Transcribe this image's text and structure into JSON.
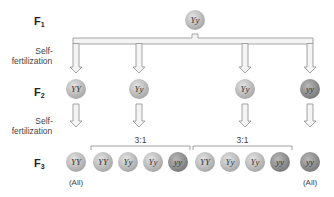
{
  "generations": {
    "f1": {
      "letter": "F",
      "sub": "1"
    },
    "f2": {
      "letter": "F",
      "sub": "2"
    },
    "f3": {
      "letter": "F",
      "sub": "3"
    }
  },
  "process_label": {
    "line1": "Self-",
    "line2": "fertilization"
  },
  "f1_plant": {
    "genotype": "Yy",
    "shade": "light"
  },
  "f2_plants": [
    {
      "genotype": "YY",
      "shade": "light"
    },
    {
      "genotype": "Yy",
      "shade": "light"
    },
    {
      "genotype": "Yy",
      "shade": "light"
    },
    {
      "genotype": "yy",
      "shade": "dark"
    }
  ],
  "f3_groups": [
    {
      "label": "(All)",
      "plants": [
        {
          "genotype": "YY",
          "shade": "light"
        }
      ]
    },
    {
      "ratio": "3:1",
      "plants": [
        {
          "genotype": "YY",
          "shade": "light"
        },
        {
          "genotype": "Yy",
          "shade": "light"
        },
        {
          "genotype": "Yy",
          "shade": "light"
        },
        {
          "genotype": "yy",
          "shade": "dark"
        }
      ]
    },
    {
      "ratio": "3:1",
      "plants": [
        {
          "genotype": "YY",
          "shade": "light"
        },
        {
          "genotype": "Yy",
          "shade": "light"
        },
        {
          "genotype": "Yy",
          "shade": "light"
        },
        {
          "genotype": "yy",
          "shade": "dark"
        }
      ]
    },
    {
      "label": "(All)",
      "plants": [
        {
          "genotype": "yy",
          "shade": "dark"
        }
      ]
    }
  ],
  "colors": {
    "light_center": "#e4e4e4",
    "light_edge": "#a8a8a8",
    "dark_center": "#b8b8b8",
    "dark_edge": "#7a7a7a",
    "arrow_fill": "#f4f4f4",
    "arrow_stroke": "#9a9a9a",
    "bracket": "#888888"
  }
}
